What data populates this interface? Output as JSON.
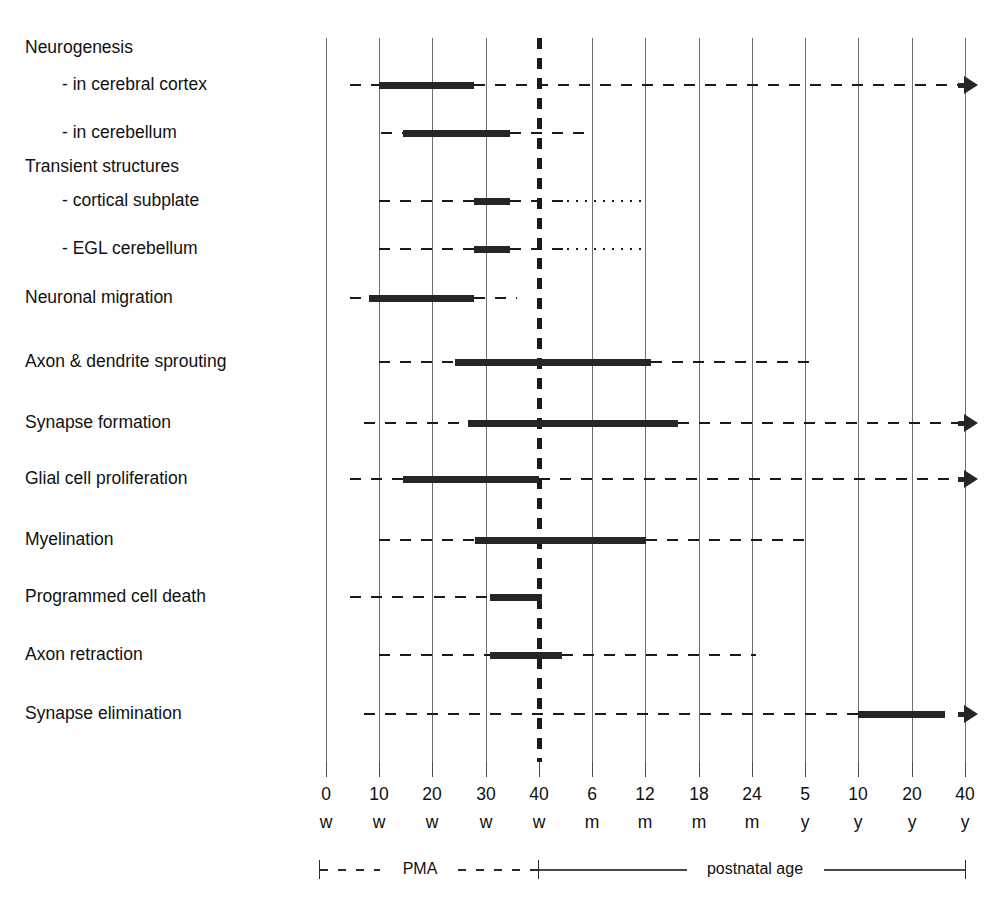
{
  "chart_data": {
    "type": "timeline",
    "title": "",
    "xlabel": "",
    "ylabel": "",
    "grid": true,
    "legend": null,
    "axis": {
      "tick_values": [
        "0",
        "10",
        "20",
        "30",
        "40",
        "6",
        "12",
        "18",
        "24",
        "5",
        "10",
        "20",
        "40"
      ],
      "tick_units": [
        "w",
        "w",
        "w",
        "w",
        "w",
        "m",
        "m",
        "m",
        "m",
        "y",
        "y",
        "y",
        "y"
      ],
      "tick_labels": [
        "0 w",
        "10 w",
        "20 w",
        "30 w",
        "40 w",
        "6 m",
        "12 m",
        "18 m",
        "24 m",
        "5 y",
        "10 y",
        "20 y",
        "40 y"
      ],
      "tick_x_px": [
        326,
        379,
        432,
        486,
        539,
        592,
        645,
        699,
        752,
        805,
        858,
        912,
        965
      ],
      "birth_marker_label": "40 w",
      "birth_marker_x_px": 539,
      "period_left_label": "PMA",
      "period_right_label": "postnatal age"
    },
    "rows": [
      {
        "label": "Neurogenesis",
        "is_header": true,
        "label_indent": false,
        "y_px": 48,
        "segments": []
      },
      {
        "label": "- in cerebral cortex",
        "is_header": false,
        "label_indent": true,
        "y_px": 85,
        "segments": [
          {
            "kind": "dash",
            "x1": 350,
            "x2": 379
          },
          {
            "kind": "bar",
            "x1": 379,
            "x2": 474
          },
          {
            "kind": "dash",
            "x1": 474,
            "x2": 958
          },
          {
            "kind": "arrow",
            "x": 958
          }
        ]
      },
      {
        "label": "- in cerebellum",
        "is_header": false,
        "label_indent": true,
        "y_px": 133,
        "segments": [
          {
            "kind": "dash",
            "x1": 381,
            "x2": 403
          },
          {
            "kind": "bar",
            "x1": 403,
            "x2": 510
          },
          {
            "kind": "dash",
            "x1": 510,
            "x2": 593
          }
        ]
      },
      {
        "label": "Transient structures",
        "is_header": true,
        "label_indent": false,
        "y_px": 167,
        "segments": []
      },
      {
        "label": "- cortical subplate",
        "is_header": false,
        "label_indent": true,
        "y_px": 201,
        "segments": [
          {
            "kind": "dash",
            "x1": 379,
            "x2": 474
          },
          {
            "kind": "bar",
            "x1": 474,
            "x2": 510
          },
          {
            "kind": "dash",
            "x1": 510,
            "x2": 567
          },
          {
            "kind": "dot",
            "x1": 567,
            "x2": 645
          }
        ]
      },
      {
        "label": "- EGL cerebellum",
        "is_header": false,
        "label_indent": true,
        "y_px": 249,
        "segments": [
          {
            "kind": "dash",
            "x1": 379,
            "x2": 474
          },
          {
            "kind": "bar",
            "x1": 474,
            "x2": 510
          },
          {
            "kind": "dash",
            "x1": 510,
            "x2": 567
          },
          {
            "kind": "dot",
            "x1": 567,
            "x2": 645
          }
        ]
      },
      {
        "label": "Neuronal migration",
        "is_header": false,
        "label_indent": false,
        "y_px": 298,
        "segments": [
          {
            "kind": "dash",
            "x1": 350,
            "x2": 369
          },
          {
            "kind": "bar",
            "x1": 369,
            "x2": 474
          },
          {
            "kind": "dash",
            "x1": 474,
            "x2": 517
          }
        ]
      },
      {
        "label": "Axon & dendrite sprouting",
        "is_header": false,
        "label_indent": false,
        "y_px": 362,
        "segments": [
          {
            "kind": "dash",
            "x1": 379,
            "x2": 455
          },
          {
            "kind": "bar",
            "x1": 455,
            "x2": 651
          },
          {
            "kind": "dash",
            "x1": 651,
            "x2": 810
          }
        ]
      },
      {
        "label": "Synapse formation",
        "is_header": false,
        "label_indent": false,
        "y_px": 423,
        "segments": [
          {
            "kind": "dash",
            "x1": 364,
            "x2": 468
          },
          {
            "kind": "bar",
            "x1": 468,
            "x2": 678
          },
          {
            "kind": "dash",
            "x1": 678,
            "x2": 958
          },
          {
            "kind": "arrow",
            "x": 958
          }
        ]
      },
      {
        "label": "Glial cell proliferation",
        "is_header": false,
        "label_indent": false,
        "y_px": 479,
        "segments": [
          {
            "kind": "dash",
            "x1": 350,
            "x2": 403
          },
          {
            "kind": "bar",
            "x1": 403,
            "x2": 539
          },
          {
            "kind": "dash",
            "x1": 539,
            "x2": 958
          },
          {
            "kind": "arrow",
            "x": 958
          }
        ]
      },
      {
        "label": "Myelination",
        "is_header": false,
        "label_indent": false,
        "y_px": 540,
        "segments": [
          {
            "kind": "dash",
            "x1": 379,
            "x2": 475
          },
          {
            "kind": "bar",
            "x1": 475,
            "x2": 646
          },
          {
            "kind": "dash",
            "x1": 646,
            "x2": 810
          }
        ]
      },
      {
        "label": "Programmed cell death",
        "is_header": false,
        "label_indent": false,
        "y_px": 597,
        "segments": [
          {
            "kind": "dash",
            "x1": 350,
            "x2": 490
          },
          {
            "kind": "bar",
            "x1": 490,
            "x2": 542
          }
        ]
      },
      {
        "label": "Axon retraction",
        "is_header": false,
        "label_indent": false,
        "y_px": 655,
        "segments": [
          {
            "kind": "dash",
            "x1": 379,
            "x2": 490
          },
          {
            "kind": "bar",
            "x1": 490,
            "x2": 562
          },
          {
            "kind": "dash",
            "x1": 562,
            "x2": 756
          }
        ]
      },
      {
        "label": "Synapse elimination",
        "is_header": false,
        "label_indent": false,
        "y_px": 714,
        "segments": [
          {
            "kind": "dash",
            "x1": 364,
            "x2": 858
          },
          {
            "kind": "bar",
            "x1": 858,
            "x2": 945
          },
          {
            "kind": "arrow",
            "x": 958
          }
        ]
      }
    ],
    "colors": {
      "bar": "#262626",
      "dash": "#1a1a1a",
      "grid": "#6f6f6f",
      "text": "#111111",
      "background": "#ffffff"
    }
  }
}
